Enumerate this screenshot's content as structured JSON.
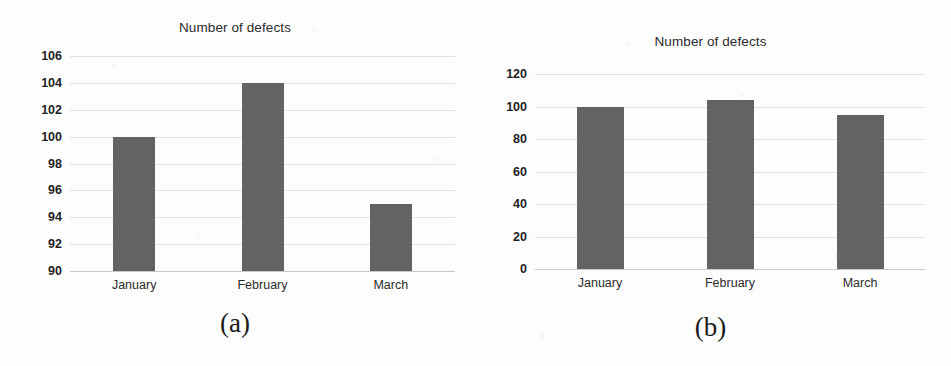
{
  "figure": {
    "panels": [
      {
        "caption": "(a)",
        "chart_data": {
          "type": "bar",
          "title": "Number of defects",
          "xlabel": "",
          "ylabel": "",
          "categories": [
            "January",
            "February",
            "March"
          ],
          "values": [
            100,
            104,
            95
          ],
          "ylim": [
            90,
            106
          ],
          "yticks": [
            106,
            104,
            102,
            100,
            98,
            96,
            94,
            92,
            90
          ],
          "grid": true,
          "legend": "none",
          "bar_color": "#636363"
        }
      },
      {
        "caption": "(b)",
        "chart_data": {
          "type": "bar",
          "title": "Number of defects",
          "xlabel": "",
          "ylabel": "",
          "categories": [
            "January",
            "February",
            "March"
          ],
          "values": [
            100,
            104,
            95
          ],
          "ylim": [
            0,
            120
          ],
          "yticks": [
            120,
            100,
            80,
            60,
            40,
            20,
            0
          ],
          "grid": true,
          "legend": "none",
          "bar_color": "#636363"
        }
      }
    ]
  }
}
